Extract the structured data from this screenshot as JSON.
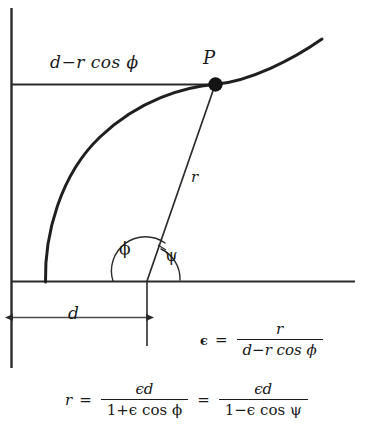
{
  "figure": {
    "type": "conic-section-focal-geometry-diagram",
    "background_color": "#ffffff",
    "ink_color": "#1a1a1a"
  },
  "labels": {
    "horizontal_segment": "d−r  cos  ϕ",
    "point": "P",
    "radius": "r",
    "angle_phi": "ϕ",
    "angle_psi": "ψ",
    "distance_d": "d"
  },
  "equations": {
    "eccentricity": {
      "lhs": "ϵ",
      "equals": "=",
      "numerator": "r",
      "denominator": "d−r  cos  ϕ"
    },
    "radius": {
      "lhs": "r",
      "equals": "=",
      "first": {
        "numerator": "ϵd",
        "denominator": "1+ϵ  cos  ϕ"
      },
      "equals2": "=",
      "second": {
        "numerator": "ϵd",
        "denominator": "1−ϵ  cos  ψ"
      }
    }
  },
  "geometry": {
    "vertical_axis": {
      "x": 11,
      "y_top": 8,
      "y_bottom": 368
    },
    "horizontal_axis": {
      "y": 281,
      "x_left": 11,
      "x_right": 355
    },
    "upper_horizontal_line": {
      "y": 84,
      "x_left": 11,
      "x_right": 215
    },
    "point_P": {
      "x": 215,
      "y": 84
    },
    "focus": {
      "x": 147,
      "y": 281
    },
    "curve_vertex": {
      "x": 45,
      "y": 281
    },
    "curve_end": {
      "x": 322,
      "y": 39
    },
    "dimension_arrow_d": {
      "y": 317,
      "x_left": 13,
      "x_right": 147
    }
  }
}
